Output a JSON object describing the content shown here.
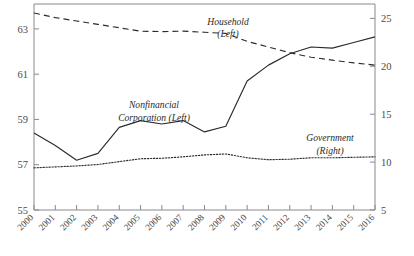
{
  "chart_data": {
    "type": "line",
    "title": "",
    "subtitle": "",
    "xlabel": "",
    "ylabel": "",
    "grid": false,
    "legend_position": "inline-annotations",
    "categories": [
      "2000",
      "2001",
      "2002",
      "2003",
      "2004",
      "2005",
      "2006",
      "2007",
      "2008",
      "2009",
      "2010",
      "2011",
      "2012",
      "2013",
      "2014",
      "2015",
      "2016"
    ],
    "left_axis": {
      "label": "",
      "ylim": [
        55,
        64.1
      ],
      "ticks": [
        55,
        57,
        59,
        61,
        63
      ],
      "ticklabels": [
        "55",
        "57",
        "59",
        "61",
        "63"
      ]
    },
    "right_axis": {
      "label": "",
      "ylim": [
        5,
        26.5
      ],
      "ticks": [
        5,
        10,
        15,
        20,
        25
      ],
      "ticklabels": [
        "5",
        "10",
        "15",
        "20",
        "25"
      ]
    },
    "series": [
      {
        "name": "Household (Left)",
        "axis": "left",
        "style": "dashed",
        "color": "#2b2b2b",
        "annotation_line1": "Household",
        "annotation_line2": "(Left)",
        "values": [
          63.7,
          63.5,
          63.35,
          63.2,
          63.05,
          62.9,
          62.88,
          62.9,
          62.85,
          62.8,
          62.45,
          62.2,
          61.95,
          61.75,
          61.62,
          61.5,
          61.4
        ]
      },
      {
        "name": "Nonfinancial Corporation (Left)",
        "axis": "left",
        "style": "solid",
        "color": "#2b2b2b",
        "annotation_line1": "Nonfinancial",
        "annotation_line2": "Corporation (Left)",
        "values": [
          58.4,
          57.85,
          57.2,
          57.5,
          58.65,
          58.95,
          58.8,
          58.95,
          58.45,
          58.7,
          60.7,
          61.4,
          61.9,
          62.2,
          62.15,
          62.4,
          62.65
        ]
      },
      {
        "name": "Government (Right)",
        "axis": "right",
        "style": "dotted",
        "color": "#2b2b2b",
        "annotation_line1": "Government",
        "annotation_line2": "(Right)",
        "values": [
          9.4,
          9.5,
          9.6,
          9.75,
          10.05,
          10.35,
          10.4,
          10.55,
          10.75,
          10.85,
          10.45,
          10.25,
          10.3,
          10.45,
          10.45,
          10.5,
          10.55
        ]
      }
    ]
  }
}
